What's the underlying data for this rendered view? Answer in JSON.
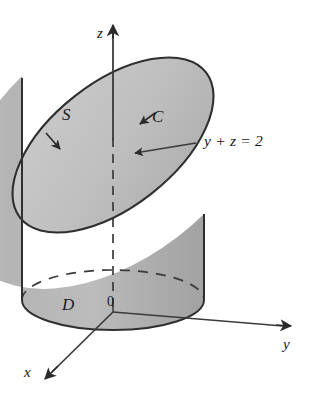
{
  "figure": {
    "background_color": "#ffffff",
    "stroke_color": "#333333",
    "surface_fill": "#b9b9b9",
    "top_fill": "#c4c4c4",
    "labels": {
      "axis_z": "z",
      "axis_y": "y",
      "axis_x": "x",
      "origin": "0",
      "surface_s": "S",
      "curve_c": "C",
      "region_d": "D",
      "plane_equation": "y + z = 2"
    },
    "icons": {
      "z_arrow": "arrow-up-icon",
      "y_arrow": "arrow-right-icon",
      "x_arrow": "arrow-down-left-icon",
      "orientation_arrow_left": "curve-direction-arrow-icon",
      "orientation_arrow_right": "curve-direction-arrow-icon",
      "pointer_arrow": "annotation-pointer-arrow-icon"
    },
    "elements": {
      "cylinder_body": "cylinder-lateral-surface",
      "top_ellipse": "slanted-top-ellipse-curve-c",
      "base_ellipse": "base-disk-d",
      "z_axis_dashed_segment": "hidden-z-axis-segment"
    }
  }
}
